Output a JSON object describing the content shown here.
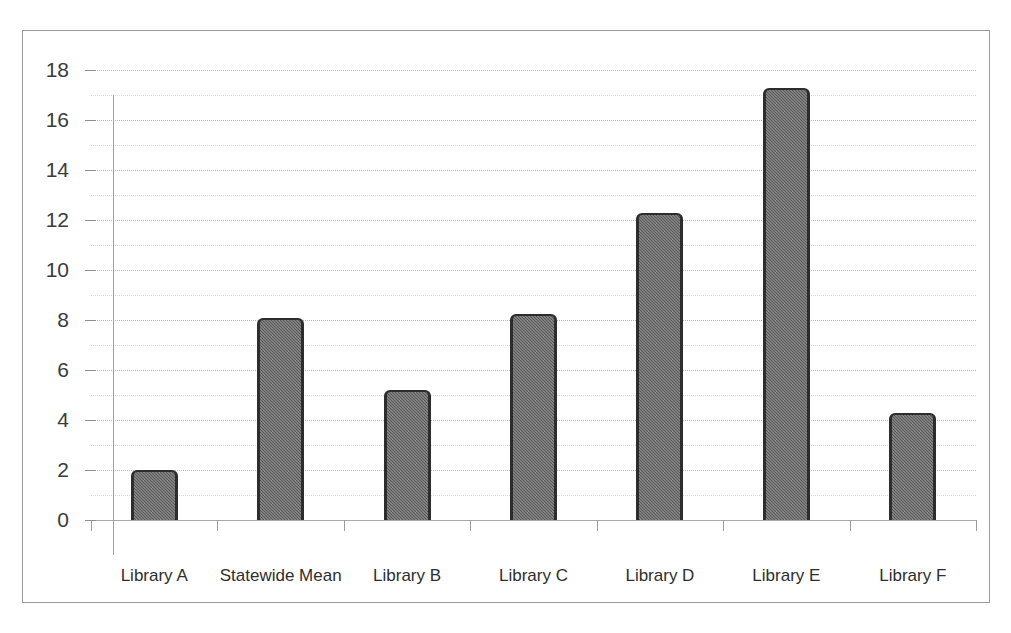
{
  "chart_data": {
    "type": "bar",
    "title": "",
    "subtitle": "",
    "xlabel": "",
    "ylabel": "",
    "categories": [
      "Library A",
      "Statewide Mean",
      "Library B",
      "Library C",
      "Library D",
      "Library E",
      "Library F"
    ],
    "values": [
      2.0,
      8.1,
      5.2,
      8.25,
      12.3,
      17.3,
      4.3
    ],
    "ylim": [
      0,
      18
    ],
    "ytick_labels": [
      "0",
      "2",
      "4",
      "6",
      "8",
      "10",
      "12",
      "14",
      "16",
      "18"
    ],
    "ytick_values": [
      0,
      2,
      4,
      6,
      8,
      10,
      12,
      14,
      16,
      18
    ],
    "ytick_step": 2,
    "minor_gridline_step": 1,
    "grid": "horizontal-dotted",
    "legend": "none",
    "legend_position": "none",
    "bar_fill_color": "#5b5b5b",
    "bar_edge_color": "#2d2d2d",
    "gridline_color": "#b5b5b5",
    "axis_color": "#9a9a9a",
    "frame_border_color": "#9a9a9a",
    "background_color": "#ffffff",
    "text_color": "#2e2e2e",
    "annotations": []
  }
}
